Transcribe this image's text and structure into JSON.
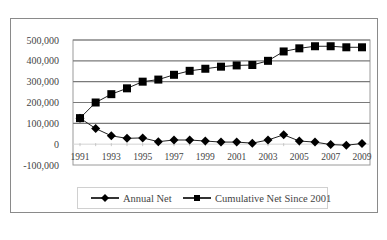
{
  "chart_data": {
    "type": "line",
    "title": "",
    "xlabel": "",
    "ylabel": "",
    "x": [
      1991,
      1992,
      1993,
      1994,
      1995,
      1996,
      1997,
      1998,
      1999,
      2000,
      2001,
      2002,
      2003,
      2004,
      2005,
      2006,
      2007,
      2008,
      2009
    ],
    "series": [
      {
        "name": "Annual Net",
        "marker": "diamond",
        "values": [
          125000,
          75000,
          40000,
          28000,
          30000,
          12000,
          20000,
          20000,
          15000,
          10000,
          10000,
          5000,
          20000,
          45000,
          15000,
          10000,
          -2000,
          -5000,
          3000
        ]
      },
      {
        "name": "Cumulative Net Since 2001",
        "marker": "square",
        "values": [
          125000,
          200000,
          240000,
          268000,
          300000,
          310000,
          333000,
          352000,
          362000,
          372000,
          378000,
          380000,
          400000,
          445000,
          460000,
          470000,
          470000,
          465000,
          465000
        ]
      }
    ],
    "ylim": [
      -100000,
      500000
    ],
    "y_ticks": [
      500000,
      400000,
      300000,
      200000,
      100000,
      0,
      -100000
    ],
    "y_tick_labels": [
      "500,000",
      "400,000",
      "300,000",
      "200,000",
      "100,000",
      "0",
      "-100,000"
    ],
    "x_tick_labels": [
      "1991",
      "1993",
      "1995",
      "1997",
      "1999",
      "2001",
      "2003",
      "2005",
      "2007",
      "2009"
    ],
    "grid": true,
    "legend_position": "bottom"
  },
  "legend": {
    "item1": "Annual Net",
    "item2": "Cumulative Net Since 2001"
  }
}
